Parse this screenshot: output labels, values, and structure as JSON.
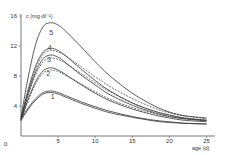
{
  "chart_data": {
    "type": "line",
    "title": "",
    "xlabel": "age (d)",
    "ylabel": "c (mg·dl⁻¹)",
    "xlim": [
      0,
      26
    ],
    "ylim": [
      0,
      16
    ],
    "xticks": [
      0,
      5,
      10,
      15,
      20,
      25
    ],
    "yticks": [
      0,
      4,
      8,
      12,
      16
    ],
    "grid": false,
    "legend": "inline curve labels",
    "series": [
      {
        "name": "1",
        "style": "solid",
        "x": [
          0,
          1,
          2,
          3,
          4,
          5,
          6,
          8,
          10,
          12,
          15,
          18,
          20,
          22,
          25
        ],
        "values": [
          2.3,
          3.8,
          5.0,
          5.8,
          6.0,
          5.8,
          5.4,
          4.6,
          3.9,
          3.3,
          2.6,
          2.1,
          1.9,
          1.7,
          1.6
        ]
      },
      {
        "name": "1b",
        "style": "solid",
        "x": [
          0,
          1,
          2,
          3,
          4,
          5,
          6,
          8,
          10,
          12,
          15,
          18,
          20,
          22,
          25
        ],
        "values": [
          2.1,
          3.6,
          4.8,
          5.6,
          5.8,
          5.6,
          5.2,
          4.4,
          3.7,
          3.1,
          2.5,
          2.0,
          1.8,
          1.7,
          1.6
        ]
      },
      {
        "name": "2",
        "style": "solid",
        "x": [
          0,
          1,
          2,
          3,
          4,
          5,
          6,
          8,
          10,
          12,
          15,
          18,
          20,
          22,
          25
        ],
        "values": [
          2.2,
          5.0,
          7.3,
          8.7,
          9.1,
          8.8,
          8.2,
          6.9,
          5.7,
          4.7,
          3.6,
          2.8,
          2.4,
          2.1,
          1.9
        ]
      },
      {
        "name": "2-dashed",
        "style": "dashed",
        "x": [
          0,
          1,
          2,
          3,
          4,
          5,
          6,
          8,
          10,
          12,
          15,
          18,
          20,
          22,
          25
        ],
        "values": [
          2.0,
          4.8,
          7.0,
          8.4,
          8.8,
          8.6,
          8.1,
          7.0,
          5.9,
          4.9,
          3.8,
          3.0,
          2.6,
          2.3,
          2.1
        ]
      },
      {
        "name": "3",
        "style": "solid",
        "x": [
          0,
          1,
          2,
          3,
          4,
          5,
          6,
          8,
          10,
          12,
          15,
          18,
          20,
          22,
          25
        ],
        "values": [
          2.3,
          5.8,
          8.6,
          10.3,
          10.8,
          10.5,
          9.8,
          8.2,
          6.8,
          5.5,
          4.1,
          3.1,
          2.6,
          2.3,
          2.0
        ]
      },
      {
        "name": "3-dashed",
        "style": "dashed",
        "x": [
          0,
          1,
          2,
          3,
          4,
          5,
          6,
          8,
          10,
          12,
          15,
          18,
          20,
          22,
          25
        ],
        "values": [
          2.1,
          5.5,
          8.2,
          9.9,
          10.4,
          10.2,
          9.7,
          8.4,
          7.1,
          5.9,
          4.4,
          3.3,
          2.8,
          2.4,
          2.1
        ]
      },
      {
        "name": "4",
        "style": "solid",
        "x": [
          0,
          1,
          2,
          3,
          4,
          5,
          6,
          8,
          10,
          12,
          15,
          18,
          20,
          22,
          25
        ],
        "values": [
          2.4,
          6.3,
          9.4,
          11.2,
          11.7,
          11.4,
          10.7,
          9.0,
          7.4,
          6.0,
          4.4,
          3.3,
          2.8,
          2.4,
          2.1
        ]
      },
      {
        "name": "4-dashed",
        "style": "dashed",
        "x": [
          0,
          1,
          2,
          3,
          4,
          5,
          6,
          8,
          10,
          12,
          15,
          18,
          20,
          22,
          25
        ],
        "values": [
          2.2,
          6.0,
          9.0,
          10.9,
          11.4,
          11.2,
          10.7,
          9.3,
          7.9,
          6.6,
          5.0,
          3.7,
          3.1,
          2.7,
          2.3
        ]
      },
      {
        "name": "5",
        "style": "solid",
        "x": [
          0,
          1,
          2,
          3,
          4,
          5,
          6,
          8,
          10,
          12,
          15,
          18,
          20,
          22,
          25
        ],
        "values": [
          2.5,
          8.0,
          12.3,
          14.6,
          15.1,
          14.8,
          14.0,
          12.0,
          9.9,
          8.0,
          5.7,
          4.0,
          3.2,
          2.7,
          2.4
        ]
      }
    ],
    "curve_labels": [
      {
        "text": "1",
        "x": 4.0,
        "y": 4.9
      },
      {
        "text": "2",
        "x": 3.4,
        "y": 8.0
      },
      {
        "text": "3",
        "x": 3.5,
        "y": 9.9
      },
      {
        "text": "4",
        "x": 3.6,
        "y": 11.5
      },
      {
        "text": "5",
        "x": 3.8,
        "y": 13.5
      }
    ]
  },
  "axes": {
    "y_title": "c (mg·dl⁻¹)",
    "x_title": "age (d)"
  }
}
